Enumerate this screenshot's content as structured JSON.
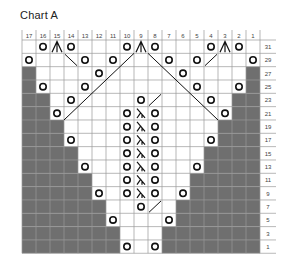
{
  "title": "Chart A",
  "colors": {
    "gray": "#6f6f6f",
    "grid": "#9a9a9a",
    "ink": "#111111"
  },
  "columns": [
    17,
    16,
    15,
    14,
    13,
    12,
    11,
    10,
    9,
    8,
    7,
    6,
    5,
    4,
    3,
    2,
    1
  ],
  "rows": [
    31,
    29,
    27,
    25,
    23,
    21,
    19,
    17,
    15,
    13,
    11,
    9,
    7,
    5,
    3,
    1
  ],
  "legend_symbols": {
    "O": "yarn-over",
    "A": "sk2p / centered double decrease",
    "L": "k2tog-variant decrease",
    "/": "k2tog",
    "\\": "ssk",
    "G": "no stitch"
  },
  "cells": {
    "31": {
      "16": "O",
      "15": "A",
      "14": "O",
      "10": "O",
      "9": "A",
      "8": "O",
      "4": "O",
      "3": "A",
      "2": "O"
    },
    "29": {
      "17": "O",
      "14": "\\",
      "13": "O",
      "11": "O",
      "7": "O",
      "5": "O",
      "4": "/",
      "1": "O"
    },
    "27": {
      "17": "G",
      "12": "O",
      "6": "O",
      "1": "G"
    },
    "25": {
      "17": "G",
      "16": "O",
      "13": "O",
      "5": "O",
      "2": "O",
      "1": "G"
    },
    "23": {
      "17": "G",
      "16": "G",
      "14": "O",
      "9": "O",
      "8": "/",
      "4": "O",
      "2": "G",
      "1": "G"
    },
    "21": {
      "17": "G",
      "16": "G",
      "15": "O",
      "10": "O",
      "9": "L",
      "8": "O",
      "3": "O",
      "2": "G",
      "1": "G"
    },
    "19": {
      "17": "G",
      "16": "G",
      "15": "G",
      "10": "O",
      "9": "L",
      "8": "O",
      "3": "G",
      "2": "G",
      "1": "G"
    },
    "17": {
      "17": "G",
      "16": "G",
      "15": "G",
      "14": "O",
      "10": "O",
      "9": "L",
      "8": "O",
      "4": "O",
      "3": "G",
      "2": "G",
      "1": "G"
    },
    "15": {
      "17": "G",
      "16": "G",
      "15": "G",
      "14": "G",
      "10": "O",
      "9": "L",
      "8": "O",
      "4": "G",
      "3": "G",
      "2": "G",
      "1": "G"
    },
    "13": {
      "17": "G",
      "16": "G",
      "15": "G",
      "14": "G",
      "13": "O",
      "10": "O",
      "9": "L",
      "8": "O",
      "5": "O",
      "4": "G",
      "3": "G",
      "2": "G",
      "1": "G"
    },
    "11": {
      "17": "G",
      "16": "G",
      "15": "G",
      "14": "G",
      "13": "G",
      "10": "O",
      "9": "L",
      "8": "O",
      "5": "G",
      "4": "G",
      "3": "G",
      "2": "G",
      "1": "G"
    },
    "9": {
      "17": "G",
      "16": "G",
      "15": "G",
      "14": "G",
      "13": "G",
      "12": "O",
      "10": "O",
      "9": "L",
      "8": "O",
      "6": "O",
      "5": "G",
      "4": "G",
      "3": "G",
      "2": "G",
      "1": "G"
    },
    "7": {
      "17": "G",
      "16": "G",
      "15": "G",
      "14": "G",
      "13": "G",
      "12": "G",
      "9": "O",
      "8": "/",
      "6": "G",
      "5": "G",
      "4": "G",
      "3": "G",
      "2": "G",
      "1": "G"
    },
    "5": {
      "17": "G",
      "16": "G",
      "15": "G",
      "14": "G",
      "13": "G",
      "12": "G",
      "11": "O",
      "7": "O",
      "6": "G",
      "5": "G",
      "4": "G",
      "3": "G",
      "2": "G",
      "1": "G"
    },
    "3": {
      "17": "G",
      "16": "G",
      "15": "G",
      "14": "G",
      "13": "G",
      "12": "G",
      "11": "G",
      "7": "G",
      "6": "G",
      "5": "G",
      "4": "G",
      "3": "G",
      "2": "G",
      "1": "G"
    },
    "1": {
      "17": "G",
      "16": "G",
      "15": "G",
      "14": "G",
      "13": "G",
      "12": "G",
      "11": "G",
      "10": "O",
      "8": "O",
      "7": "G",
      "6": "G",
      "5": "G",
      "4": "G",
      "3": "G",
      "2": "G",
      "1": "G"
    }
  },
  "long_lines": [
    {
      "from_col": 10,
      "from_row": 29,
      "to_col": 14,
      "to_row": 21,
      "dir": "/"
    },
    {
      "from_col": 8,
      "from_row": 29,
      "to_col": 4,
      "to_row": 21,
      "dir": "\\"
    }
  ]
}
